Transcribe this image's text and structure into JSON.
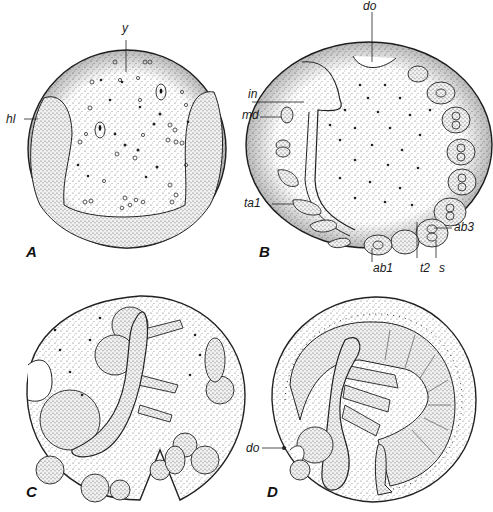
{
  "figure": {
    "panels": [
      {
        "id": "A",
        "letter": "A",
        "labels": [
          "y",
          "hl"
        ]
      },
      {
        "id": "B",
        "letter": "B",
        "labels": [
          "do",
          "in",
          "md",
          "ta1",
          "ab1",
          "t2",
          "s",
          "ab3"
        ]
      },
      {
        "id": "C",
        "letter": "C",
        "labels": []
      },
      {
        "id": "D",
        "letter": "D",
        "labels": [
          "do"
        ]
      }
    ]
  },
  "labels": {
    "A": {
      "letter": "A",
      "y": "y",
      "hl": "hl"
    },
    "B": {
      "letter": "B",
      "do": "do",
      "in": "in",
      "md": "md",
      "ta1": "ta1",
      "ab1": "ab1",
      "t2": "t2",
      "s": "s",
      "ab3": "ab3"
    },
    "C": {
      "letter": "C"
    },
    "D": {
      "letter": "D",
      "do": "do"
    }
  },
  "colors": {
    "ink": "#1a1a1a",
    "stipple": "#555555",
    "paper": "#ffffff"
  }
}
